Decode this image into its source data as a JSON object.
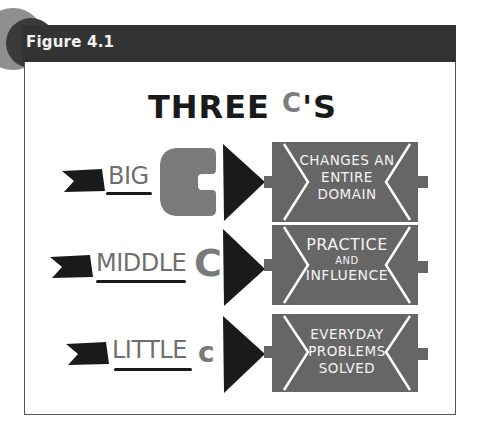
{
  "figure": {
    "label": "Figure 4.1",
    "title_word": "THREE",
    "title_c": "C",
    "title_suffix": "'S"
  },
  "rows": [
    {
      "label": "BIG",
      "c_glyph": "C",
      "c_size": "big",
      "banner_lines": [
        "CHANGES AN",
        "ENTIRE",
        "DOMAIN"
      ]
    },
    {
      "label": "MIDDLE",
      "c_glyph": "C",
      "c_size": "medium",
      "banner_lines": [
        "PRACTICE",
        "AND",
        "INFLUENCE"
      ]
    },
    {
      "label": "LITTLE",
      "c_glyph": "c",
      "c_size": "small",
      "banner_lines": [
        "EVERYDAY",
        "PROBLEMS",
        "SOLVED"
      ]
    }
  ],
  "colors": {
    "header": "#333333",
    "grey_accent": "#7a7a7a",
    "ink": "#1a1a1a",
    "banner": "#666666"
  },
  "icons": [
    "ribbon-flag-icon",
    "triangle-arrow-icon",
    "banner-scroll-icon"
  ]
}
